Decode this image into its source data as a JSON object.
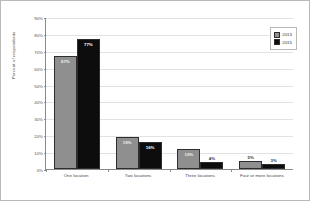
{
  "chart_data": {
    "type": "bar",
    "title": "",
    "subtitle": "",
    "xlabel": "",
    "ylabel": "Percent of respondents",
    "categories": [
      "One location",
      "Two locations",
      "Three locations",
      "Four or more locations"
    ],
    "series": [
      {
        "name": "2013",
        "color": "#8f8f8f",
        "values": [
          67,
          19,
          12,
          5
        ],
        "labels": [
          "67%",
          "19%",
          "12%",
          "5%"
        ]
      },
      {
        "name": "2015",
        "color": "#0d0d0d",
        "values": [
          77,
          16,
          4,
          3
        ],
        "labels": [
          "77%",
          "16%",
          "4%",
          "3%"
        ]
      }
    ],
    "ylim": [
      0,
      90
    ],
    "yticks": [
      0,
      10,
      20,
      30,
      40,
      50,
      60,
      70,
      80,
      90
    ],
    "ytick_labels": [
      "0%",
      "10%",
      "20%",
      "30%",
      "40%",
      "50%",
      "60%",
      "70%",
      "80%",
      "90%"
    ],
    "grid": true,
    "legend_position": "top-right"
  },
  "legend": {
    "items": [
      {
        "label": "2013",
        "color": "#8f8f8f"
      },
      {
        "label": "2015",
        "color": "#0d0d0d"
      }
    ]
  },
  "colors": {
    "series_2013": "#8f8f8f",
    "series_2015": "#0d0d0d",
    "gridline": "#e2e2e2",
    "axis": "#8a8a8a",
    "border": "#b9b9b9"
  }
}
